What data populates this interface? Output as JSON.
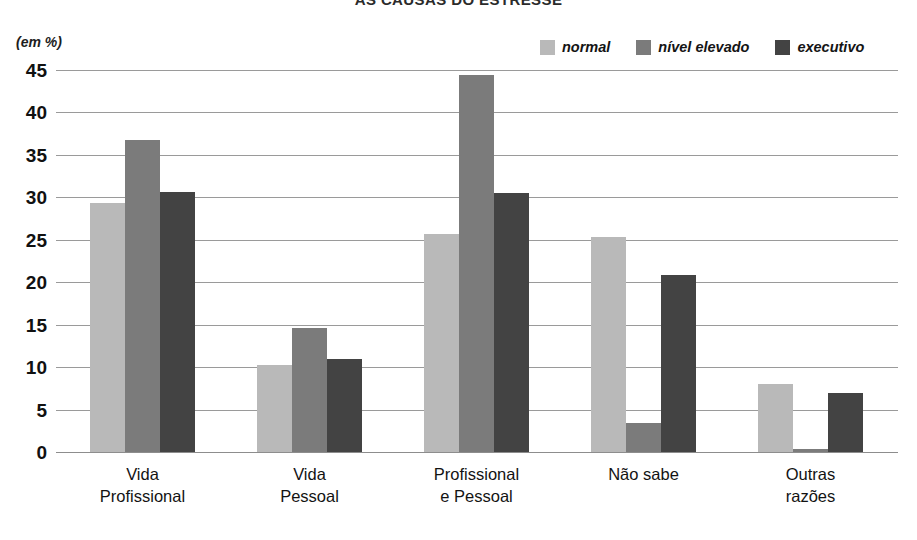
{
  "title": "AS CAUSAS DO ESTRESSE",
  "unit_note": "(em %)",
  "legend": [
    {
      "label": "normal",
      "color": "#b9b9b9"
    },
    {
      "label": "nível elevado",
      "color": "#7b7b7b"
    },
    {
      "label": "executivo",
      "color": "#434343"
    }
  ],
  "chart_data": {
    "type": "bar",
    "title": "AS CAUSAS DO ESTRESSE",
    "xlabel": "",
    "ylabel": "(em %)",
    "ylim": [
      0,
      45
    ],
    "yticks": [
      0,
      5,
      10,
      15,
      20,
      25,
      30,
      35,
      40,
      45
    ],
    "grid": true,
    "legend_position": "top-right",
    "categories": [
      "Vida\nProfissional",
      "Vida\nPessoal",
      "Profissional\ne Pessoal",
      "Não sabe",
      "Outras\nrazões"
    ],
    "series": [
      {
        "name": "normal",
        "color": "#b9b9b9",
        "values": [
          29.3,
          10.3,
          25.7,
          25.3,
          8.0
        ]
      },
      {
        "name": "nível elevado",
        "color": "#7b7b7b",
        "values": [
          36.8,
          14.6,
          44.4,
          3.4,
          0.3
        ]
      },
      {
        "name": "executivo",
        "color": "#434343",
        "values": [
          30.6,
          11.0,
          30.5,
          20.8,
          7.0
        ]
      }
    ]
  }
}
